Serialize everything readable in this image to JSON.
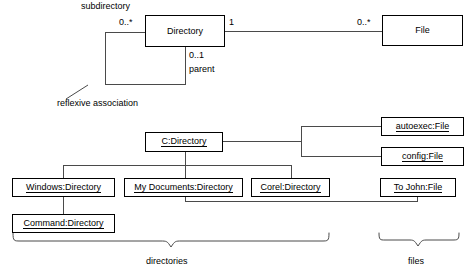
{
  "diagram": {
    "line_color": "#4a4a4a",
    "text_color": "#000000",
    "background": "#ffffff"
  },
  "class_diagram": {
    "classes": [
      {
        "id": "directory-class",
        "name": "Directory"
      },
      {
        "id": "file-class",
        "name": "File"
      }
    ],
    "role_labels": {
      "subdirectory": "subdirectory",
      "parent": "parent"
    },
    "multiplicities": {
      "subdirectory_end": "0..*",
      "directory_to_file_end": "1",
      "file_end": "0..*",
      "parent_end": "0..1"
    },
    "annotation": "reflexive association"
  },
  "object_diagram": {
    "objects": [
      {
        "id": "c-directory",
        "name": "C:Directory",
        "kind": "directory"
      },
      {
        "id": "windows-directory",
        "name": "Windows:Directory",
        "kind": "directory"
      },
      {
        "id": "my-documents-directory",
        "name": "My Documents:Directory",
        "kind": "directory"
      },
      {
        "id": "corel-directory",
        "name": "Corel:Directory",
        "kind": "directory"
      },
      {
        "id": "command-directory",
        "name": "Command:Directory",
        "kind": "directory"
      },
      {
        "id": "autoexec-file",
        "name": "autoexec:File",
        "kind": "file"
      },
      {
        "id": "config-file",
        "name": "config:File",
        "kind": "file"
      },
      {
        "id": "to-john-file",
        "name": "To John:File",
        "kind": "file"
      }
    ],
    "group_labels": {
      "directories": "directories",
      "files": "files"
    }
  }
}
